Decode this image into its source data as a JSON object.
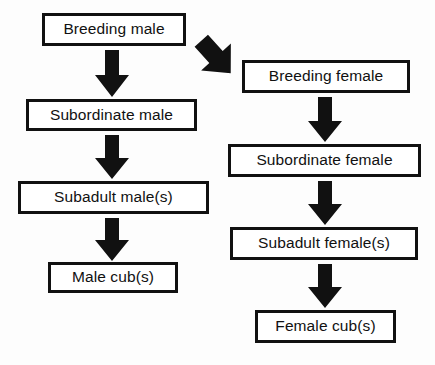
{
  "diagram": {
    "background_color": "#fdfdfd",
    "line_color": "#111111",
    "text_color": "#111111",
    "nodes": [
      {
        "id": "breeding-male",
        "label": "Breeding male",
        "column": "male"
      },
      {
        "id": "subordinate-male",
        "label": "Subordinate male",
        "column": "male"
      },
      {
        "id": "subadult-male",
        "label": "Subadult male(s)",
        "column": "male"
      },
      {
        "id": "male-cub",
        "label": "Male cub(s)",
        "column": "male"
      },
      {
        "id": "breeding-female",
        "label": "Breeding female",
        "column": "female"
      },
      {
        "id": "subordinate-female",
        "label": "Subordinate female",
        "column": "female"
      },
      {
        "id": "subadult-female",
        "label": "Subadult female(s)",
        "column": "female"
      },
      {
        "id": "female-cub",
        "label": "Female cub(s)",
        "column": "female"
      }
    ],
    "edges": [
      {
        "id": "bm-sm",
        "from": "breeding-male",
        "to": "subordinate-male",
        "direction": "down"
      },
      {
        "id": "sm-sam",
        "from": "subordinate-male",
        "to": "subadult-male",
        "direction": "down"
      },
      {
        "id": "sam-mc",
        "from": "subadult-male",
        "to": "male-cub",
        "direction": "down"
      },
      {
        "id": "bm-bf",
        "from": "breeding-male",
        "to": "breeding-female",
        "direction": "down-right"
      },
      {
        "id": "bf-sf",
        "from": "breeding-female",
        "to": "subordinate-female",
        "direction": "down"
      },
      {
        "id": "sf-saf",
        "from": "subordinate-female",
        "to": "subadult-female",
        "direction": "down"
      },
      {
        "id": "saf-fc",
        "from": "subadult-female",
        "to": "female-cub",
        "direction": "down"
      }
    ]
  }
}
